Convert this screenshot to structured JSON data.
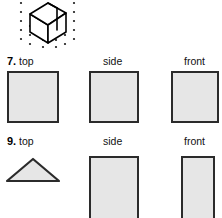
{
  "page": {
    "kind": "geometry-worksheet-fragment",
    "background_color": "#ffffff",
    "shape_fill_color": "#e6e6e6",
    "shape_stroke_color": "#2b2b2b",
    "dot_color": "#1a1a1a",
    "line_color": "#000000"
  },
  "isometric_drawing": {
    "name": "isometric-cube-figure",
    "description": "isometric solid drawn on a triangular dot grid",
    "dot_grid": {
      "rows": 5,
      "dot_radius": 1,
      "dots": [
        {
          "x": 21,
          "y": 3
        },
        {
          "x": 21,
          "y": 12
        },
        {
          "x": 21,
          "y": 21
        },
        {
          "x": 21,
          "y": 30
        },
        {
          "x": 21,
          "y": 39
        },
        {
          "x": 30,
          "y": 26
        },
        {
          "x": 30,
          "y": 35
        },
        {
          "x": 30,
          "y": 44
        },
        {
          "x": 43,
          "y": 40
        },
        {
          "x": 43,
          "y": 47
        },
        {
          "x": 56,
          "y": 40
        },
        {
          "x": 56,
          "y": 47
        },
        {
          "x": 65,
          "y": 26
        },
        {
          "x": 65,
          "y": 35
        },
        {
          "x": 65,
          "y": 44
        },
        {
          "x": 74,
          "y": 3
        },
        {
          "x": 74,
          "y": 12
        },
        {
          "x": 74,
          "y": 21
        },
        {
          "x": 74,
          "y": 30
        },
        {
          "x": 74,
          "y": 39
        }
      ]
    },
    "solid_outline": "M 30,14 L 30,32 L 48,43 L 48,26 Z M 30,14 L 48,4 L 66,14 L 48,26 Z M 48,26 L 48,43 L 66,32 L 66,14 Z",
    "inner_edges": [
      {
        "x1": 48,
        "y1": 4,
        "x2": 48,
        "y2": 26
      },
      {
        "x1": 57,
        "y1": 9,
        "x2": 57,
        "y2": 31
      }
    ]
  },
  "problems": [
    {
      "number": "7.",
      "views": [
        {
          "label": "top",
          "shape": "square",
          "name": "view-shape-top"
        },
        {
          "label": "side",
          "shape": "square",
          "name": "view-shape-side"
        },
        {
          "label": "front",
          "shape": "square",
          "name": "view-shape-front"
        }
      ]
    },
    {
      "number": "9.",
      "views": [
        {
          "label": "top",
          "shape": "triangle",
          "name": "view-shape-top"
        },
        {
          "label": "side",
          "shape": "rectangle",
          "name": "view-shape-side"
        },
        {
          "label": "front",
          "shape": "rectangle",
          "name": "view-shape-front"
        }
      ]
    }
  ]
}
